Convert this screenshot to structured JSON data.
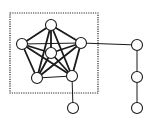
{
  "diagram": {
    "type": "graph",
    "cluster_box": {
      "x": 10,
      "y": 13,
      "width": 88,
      "height": 80,
      "style": "dotted"
    },
    "nodes": [
      {
        "id": "top",
        "x": 51,
        "y": 25
      },
      {
        "id": "left",
        "x": 22,
        "y": 44
      },
      {
        "id": "right",
        "x": 81,
        "y": 43
      },
      {
        "id": "center",
        "x": 51,
        "y": 53
      },
      {
        "id": "bottom-left",
        "x": 37,
        "y": 78
      },
      {
        "id": "bottom-right",
        "x": 72,
        "y": 76
      },
      {
        "id": "chain-1",
        "x": 137,
        "y": 45
      },
      {
        "id": "chain-2",
        "x": 137,
        "y": 77
      },
      {
        "id": "chain-3",
        "x": 137,
        "y": 108
      },
      {
        "id": "pendant-bottom",
        "x": 73,
        "y": 108
      }
    ],
    "edges": [
      {
        "from": "top",
        "to": "left",
        "weight": "thick"
      },
      {
        "from": "top",
        "to": "right",
        "weight": "thick"
      },
      {
        "from": "top",
        "to": "center",
        "weight": "thick"
      },
      {
        "from": "top",
        "to": "bottom-left",
        "weight": "thick"
      },
      {
        "from": "top",
        "to": "bottom-right",
        "weight": "thick"
      },
      {
        "from": "left",
        "to": "right",
        "weight": "thin"
      },
      {
        "from": "left",
        "to": "center",
        "weight": "thick"
      },
      {
        "from": "left",
        "to": "bottom-left",
        "weight": "thick"
      },
      {
        "from": "left",
        "to": "bottom-right",
        "weight": "thick"
      },
      {
        "from": "right",
        "to": "center",
        "weight": "thick"
      },
      {
        "from": "right",
        "to": "bottom-left",
        "weight": "thick"
      },
      {
        "from": "right",
        "to": "bottom-right",
        "weight": "thick"
      },
      {
        "from": "center",
        "to": "bottom-left",
        "weight": "thick"
      },
      {
        "from": "center",
        "to": "bottom-right",
        "weight": "thick"
      },
      {
        "from": "bottom-left",
        "to": "bottom-right",
        "weight": "thin"
      },
      {
        "from": "right",
        "to": "chain-1",
        "weight": "thin"
      },
      {
        "from": "chain-1",
        "to": "chain-2",
        "weight": "thin"
      },
      {
        "from": "chain-2",
        "to": "chain-3",
        "weight": "thin"
      },
      {
        "from": "bottom-right",
        "to": "pendant-bottom",
        "weight": "thin"
      }
    ],
    "node_radius": 5.5,
    "colors": {
      "stroke": "#1a1a1a",
      "fill": "#ffffff",
      "background": "#ffffff"
    }
  }
}
